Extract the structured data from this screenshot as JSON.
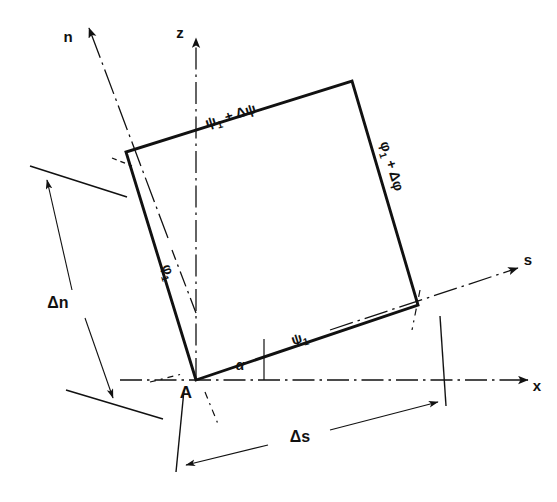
{
  "figure": {
    "kind": "engineering-geometry-diagram",
    "background_color": "#ffffff",
    "line_color": "#111111",
    "caption": ""
  },
  "axes": [
    {
      "id": "z",
      "label": "z",
      "style": "dash-dot",
      "arrow": "up",
      "from": [
        196,
        380
      ],
      "to": [
        196,
        38
      ],
      "label_pos": [
        183,
        32
      ]
    },
    {
      "id": "x",
      "label": "x",
      "style": "dash-dot",
      "arrow": "right",
      "from": [
        120,
        380
      ],
      "to": [
        528,
        380
      ],
      "label_pos": [
        534,
        387
      ]
    },
    {
      "id": "n",
      "label": "n",
      "style": "dash-dot",
      "arrow": "up-left",
      "from": [
        160,
        215
      ],
      "to": [
        89,
        28
      ],
      "label_pos": [
        66,
        37
      ]
    },
    {
      "id": "s",
      "label": "s",
      "style": "dash-dot",
      "arrow": "up-right",
      "from": [
        330,
        330
      ],
      "to": [
        520,
        268
      ],
      "label_pos": [
        526,
        262
      ]
    }
  ],
  "element": {
    "name": "differential-quadrilateral",
    "vertices": {
      "A": [
        196,
        380
      ],
      "top_left": [
        126,
        152
      ],
      "top_right": [
        352,
        81
      ],
      "bottom_right": [
        418,
        305
      ]
    },
    "vertex_labels": [
      {
        "id": "A",
        "text": "A",
        "pos": [
          186,
          397
        ]
      }
    ]
  },
  "edge_labels": [
    {
      "id": "top-edge",
      "text": "ψ",
      "sub": "1",
      "suffix": " + Δψ",
      "pos": [
        212,
        122
      ],
      "rotate": -17.5
    },
    {
      "id": "bottom-edge",
      "text": "ψ",
      "sub": "1",
      "suffix": "",
      "pos": [
        300,
        348
      ],
      "rotate": -17.5
    },
    {
      "id": "left-edge",
      "text": "φ",
      "sub": "1",
      "suffix": "",
      "pos": [
        165,
        270
      ],
      "rotate": 73
    },
    {
      "id": "right-edge",
      "text": "φ",
      "sub": "1",
      "suffix": " + Δφ",
      "pos": [
        381,
        150
      ],
      "rotate": 73
    }
  ],
  "angle_labels": [
    {
      "id": "alpha",
      "text": "α",
      "pos": [
        238,
        367
      ]
    }
  ],
  "dimensions": [
    {
      "id": "delta-n",
      "label": "Δn",
      "label_pos": [
        60,
        302
      ],
      "arrow_from": [
        45,
        177
      ],
      "arrow_to": [
        113,
        397
      ],
      "extension_lines": [
        [
          [
            32,
            166
          ],
          [
            125,
            196
          ]
        ],
        [
          [
            68,
            389
          ],
          [
            160,
            418
          ]
        ]
      ]
    },
    {
      "id": "delta-s",
      "label": "Δs",
      "label_pos": [
        298,
        437
      ],
      "arrow_from": [
        190,
        462
      ],
      "arrow_to": [
        437,
        400
      ],
      "extension_lines": [
        [
          [
            184,
            392
          ],
          [
            178,
            470
          ]
        ],
        [
          [
            438,
            318
          ],
          [
            443,
            404
          ]
        ]
      ]
    }
  ],
  "tick_marks": [
    {
      "id": "alpha-tick",
      "from": [
        263,
        341
      ],
      "to": [
        263,
        380
      ]
    }
  ]
}
